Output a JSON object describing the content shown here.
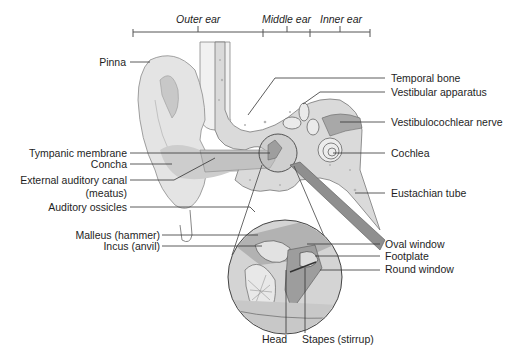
{
  "diagram": {
    "regions": [
      {
        "label": "Outer ear"
      },
      {
        "label": "Middle ear"
      },
      {
        "label": "Inner ear"
      }
    ],
    "left_labels": [
      {
        "label": "Pinna"
      },
      {
        "label": "Tympanic membrane"
      },
      {
        "label": "Concha"
      },
      {
        "label": "External auditory canal"
      },
      {
        "label": "(meatus)"
      },
      {
        "label": "Auditory ossicles"
      },
      {
        "label": "Malleus (hammer)"
      },
      {
        "label": "Incus (anvil)"
      }
    ],
    "right_labels": [
      {
        "label": "Temporal bone"
      },
      {
        "label": "Vestibular apparatus"
      },
      {
        "label": "Vestibulocochlear nerve"
      },
      {
        "label": "Cochlea"
      },
      {
        "label": "Eustachian tube"
      },
      {
        "label": "Oval window"
      },
      {
        "label": "Footplate"
      },
      {
        "label": "Round window"
      }
    ],
    "bottom_labels": [
      {
        "label": "Head"
      },
      {
        "label": "Stapes (stirrup)"
      }
    ],
    "colors": {
      "skin_light": "#e6e6e6",
      "skin_mid": "#cfcfcf",
      "bone": "#dcdcdc",
      "tissue_dark": "#a9a9a9",
      "outline": "#6e6e6e",
      "leader": "#333333"
    }
  }
}
